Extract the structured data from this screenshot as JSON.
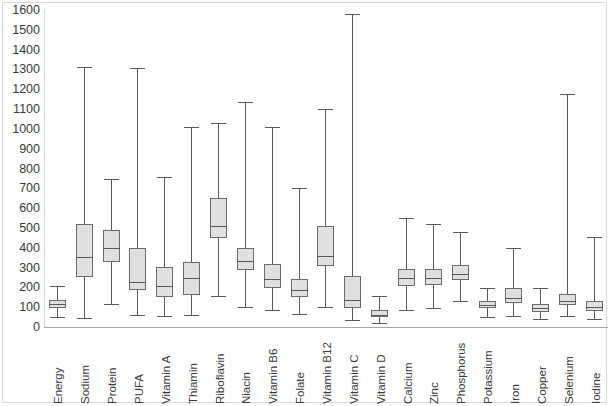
{
  "chart_data": {
    "type": "box",
    "title": "",
    "xlabel": "",
    "ylabel": "",
    "ylim": [
      0,
      1600
    ],
    "y_ticks": [
      0,
      100,
      200,
      300,
      400,
      500,
      600,
      700,
      800,
      900,
      1000,
      1100,
      1200,
      1300,
      1400,
      1500,
      1600
    ],
    "grid": false,
    "legend": "none",
    "categories": [
      "Energy",
      "Sodium",
      "Protein",
      "PUFA",
      "Vitamin A",
      "Thiamin",
      "Riboflavin",
      "Niacin",
      "Vitamin B6",
      "Folate",
      "Vitamin B12",
      "Vitamin C",
      "Vitamin D",
      "Calcium",
      "Zinc",
      "Phosphorus",
      "Potassium",
      "Iron",
      "Copper",
      "Selenium",
      "Iodine"
    ],
    "boxes": [
      {
        "category": "Energy",
        "whisker_low": 50,
        "q1": 95,
        "median": 115,
        "q3": 135,
        "whisker_high": 205
      },
      {
        "category": "Sodium",
        "whisker_low": 45,
        "q1": 250,
        "median": 355,
        "q3": 520,
        "whisker_high": 1310
      },
      {
        "category": "Protein",
        "whisker_low": 115,
        "q1": 330,
        "median": 400,
        "q3": 490,
        "whisker_high": 745
      },
      {
        "category": "PUFA",
        "whisker_low": 60,
        "q1": 185,
        "median": 225,
        "q3": 400,
        "whisker_high": 1305
      },
      {
        "category": "Vitamin A",
        "whisker_low": 55,
        "q1": 150,
        "median": 205,
        "q3": 305,
        "whisker_high": 755
      },
      {
        "category": "Thiamin",
        "whisker_low": 60,
        "q1": 160,
        "median": 245,
        "q3": 330,
        "whisker_high": 1010
      },
      {
        "category": "Riboflavin",
        "whisker_low": 155,
        "q1": 450,
        "median": 510,
        "q3": 650,
        "whisker_high": 1030
      },
      {
        "category": "Niacin",
        "whisker_low": 100,
        "q1": 290,
        "median": 335,
        "q3": 400,
        "whisker_high": 1135
      },
      {
        "category": "Vitamin B6",
        "whisker_low": 85,
        "q1": 195,
        "median": 240,
        "q3": 320,
        "whisker_high": 1010
      },
      {
        "category": "Folate",
        "whisker_low": 65,
        "q1": 150,
        "median": 185,
        "q3": 240,
        "whisker_high": 700
      },
      {
        "category": "Vitamin B12",
        "whisker_low": 100,
        "q1": 310,
        "median": 360,
        "q3": 510,
        "whisker_high": 1100
      },
      {
        "category": "Vitamin C",
        "whisker_low": 35,
        "q1": 95,
        "median": 135,
        "q3": 255,
        "whisker_high": 1580
      },
      {
        "category": "Vitamin D",
        "whisker_low": 20,
        "q1": 48,
        "median": 60,
        "q3": 85,
        "whisker_high": 155
      },
      {
        "category": "Calcium",
        "whisker_low": 85,
        "q1": 205,
        "median": 245,
        "q3": 295,
        "whisker_high": 550
      },
      {
        "category": "Zinc",
        "whisker_low": 95,
        "q1": 210,
        "median": 245,
        "q3": 295,
        "whisker_high": 520
      },
      {
        "category": "Phosphorus",
        "whisker_low": 130,
        "q1": 235,
        "median": 265,
        "q3": 315,
        "whisker_high": 480
      },
      {
        "category": "Potassium",
        "whisker_low": 50,
        "q1": 95,
        "median": 110,
        "q3": 130,
        "whisker_high": 195
      },
      {
        "category": "Iron",
        "whisker_low": 55,
        "q1": 120,
        "median": 145,
        "q3": 195,
        "whisker_high": 400
      },
      {
        "category": "Copper",
        "whisker_low": 40,
        "q1": 75,
        "median": 95,
        "q3": 115,
        "whisker_high": 195
      },
      {
        "category": "Selenium",
        "whisker_low": 55,
        "q1": 110,
        "median": 130,
        "q3": 165,
        "whisker_high": 1175
      },
      {
        "category": "Iodine",
        "whisker_low": 40,
        "q1": 80,
        "median": 100,
        "q3": 130,
        "whisker_high": 455
      }
    ]
  },
  "style": {
    "box_fill": "#e0e0e0",
    "box_stroke": "#6b6b6b",
    "whisker_color": "#595959",
    "axis_color": "#a6a6a6",
    "frame_color": "#d9d9d9",
    "text_color": "#3a3a3a"
  }
}
